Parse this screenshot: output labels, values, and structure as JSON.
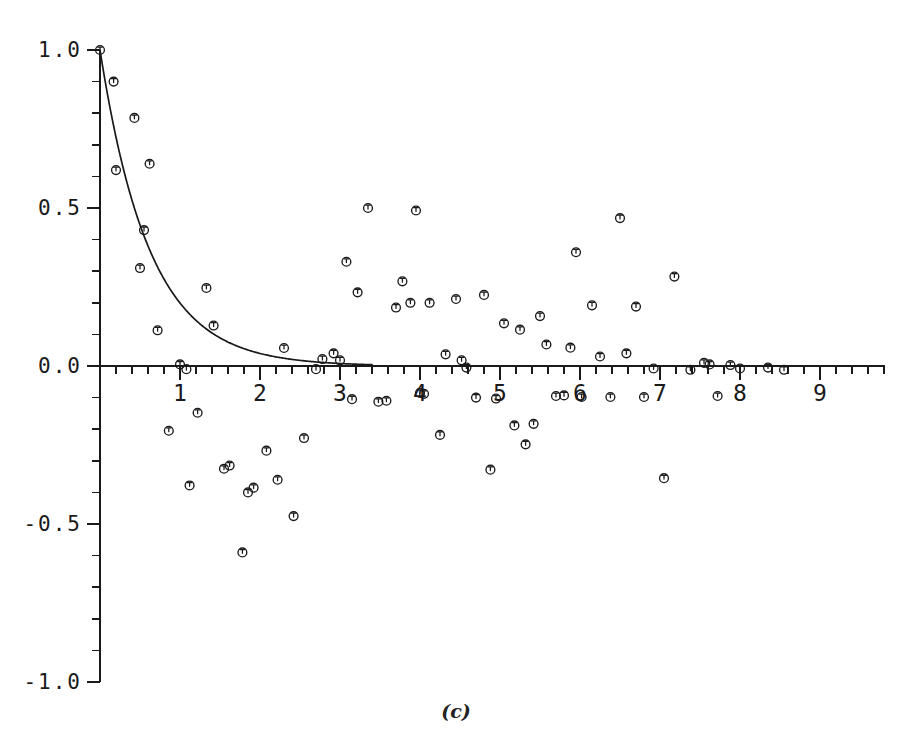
{
  "figure": {
    "caption": "(c)",
    "background_color": "#ffffff",
    "ink_color": "#1a1a1a"
  },
  "chart_data": {
    "type": "scatter",
    "title": "",
    "subtitle": "",
    "xlabel": "",
    "ylabel": "",
    "xlim": [
      0,
      9.8
    ],
    "ylim": [
      -1.0,
      1.0
    ],
    "grid": false,
    "legend": null,
    "annotations": [
      "(c)"
    ],
    "x_ticks_major": [
      1,
      2,
      3,
      4,
      5,
      6,
      7,
      8,
      9
    ],
    "x_tick_labels": [
      "1",
      "2",
      "3",
      "4",
      "5",
      "6",
      "7",
      "8",
      "9"
    ],
    "x_minor_interval": 0.2,
    "y_ticks_major": [
      -1.0,
      -0.5,
      0.0,
      0.5,
      1.0
    ],
    "y_tick_labels": [
      "-1.0",
      "-0.5",
      "0.0",
      "0.5",
      "1.0"
    ],
    "y_minor_interval": 0.1,
    "marker": "open-circle-with-stem",
    "series": [
      {
        "name": "observed",
        "type": "scatter",
        "points": [
          [
            0.0,
            1.0
          ],
          [
            0.17,
            0.9
          ],
          [
            0.2,
            0.62
          ],
          [
            0.43,
            0.785
          ],
          [
            0.5,
            0.31
          ],
          [
            0.55,
            0.43
          ],
          [
            0.62,
            0.64
          ],
          [
            0.72,
            0.113
          ],
          [
            0.86,
            -0.205
          ],
          [
            1.0,
            0.005
          ],
          [
            1.08,
            -0.01
          ],
          [
            1.12,
            -0.378
          ],
          [
            1.22,
            -0.148
          ],
          [
            1.33,
            0.247
          ],
          [
            1.42,
            0.128
          ],
          [
            1.55,
            -0.325
          ],
          [
            1.62,
            -0.315
          ],
          [
            1.78,
            -0.59
          ],
          [
            1.85,
            -0.4
          ],
          [
            1.92,
            -0.385
          ],
          [
            2.08,
            -0.268
          ],
          [
            2.22,
            -0.36
          ],
          [
            2.3,
            0.057
          ],
          [
            2.42,
            -0.475
          ],
          [
            2.55,
            -0.228
          ],
          [
            2.7,
            -0.01
          ],
          [
            2.78,
            0.022
          ],
          [
            2.92,
            0.04
          ],
          [
            3.0,
            0.018
          ],
          [
            3.08,
            0.33
          ],
          [
            3.15,
            -0.105
          ],
          [
            3.22,
            0.233
          ],
          [
            3.35,
            0.5
          ],
          [
            3.48,
            -0.113
          ],
          [
            3.58,
            -0.11
          ],
          [
            3.7,
            0.185
          ],
          [
            3.78,
            0.268
          ],
          [
            3.88,
            0.2
          ],
          [
            3.95,
            0.492
          ],
          [
            4.0,
            -0.085
          ],
          [
            4.05,
            -0.088
          ],
          [
            4.12,
            0.2
          ],
          [
            4.25,
            -0.218
          ],
          [
            4.32,
            0.037
          ],
          [
            4.45,
            0.212
          ],
          [
            4.52,
            0.018
          ],
          [
            4.58,
            -0.005
          ],
          [
            4.7,
            -0.1
          ],
          [
            4.8,
            0.225
          ],
          [
            4.88,
            -0.328
          ],
          [
            4.95,
            -0.103
          ],
          [
            5.05,
            0.135
          ],
          [
            5.18,
            -0.188
          ],
          [
            5.25,
            0.115
          ],
          [
            5.32,
            -0.248
          ],
          [
            5.42,
            -0.183
          ],
          [
            5.5,
            0.158
          ],
          [
            5.58,
            0.068
          ],
          [
            5.7,
            -0.095
          ],
          [
            5.8,
            -0.093
          ],
          [
            5.88,
            0.058
          ],
          [
            5.95,
            0.36
          ],
          [
            6.02,
            -0.098
          ],
          [
            6.15,
            0.192
          ],
          [
            6.25,
            0.03
          ],
          [
            6.38,
            -0.098
          ],
          [
            6.5,
            0.468
          ],
          [
            6.58,
            0.04
          ],
          [
            6.7,
            0.188
          ],
          [
            6.8,
            -0.098
          ],
          [
            6.92,
            -0.008
          ],
          [
            7.05,
            -0.355
          ],
          [
            7.18,
            0.283
          ],
          [
            7.38,
            -0.012
          ],
          [
            7.55,
            0.01
          ],
          [
            7.62,
            0.005
          ],
          [
            7.72,
            -0.095
          ],
          [
            7.88,
            0.003
          ],
          [
            8.0,
            -0.008
          ],
          [
            8.35,
            -0.005
          ],
          [
            8.55,
            -0.012
          ]
        ]
      },
      {
        "name": "fitted-exponential",
        "type": "line",
        "description": "exponential decay fit",
        "model": "y = exp(-x/tau)",
        "tau": 0.62,
        "x_range": [
          0.0,
          3.4
        ]
      }
    ]
  }
}
